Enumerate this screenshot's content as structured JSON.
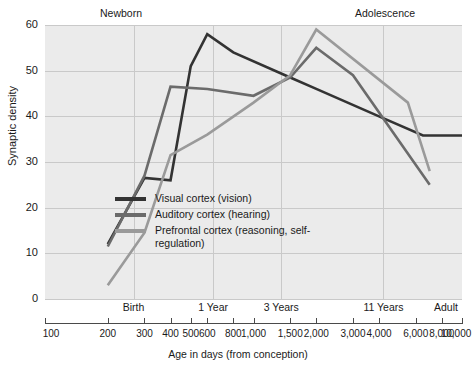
{
  "chart_data": {
    "type": "line",
    "title": "",
    "xlabel": "Age in days (from conception)",
    "ylabel": "Synaptic density",
    "xscale": "log",
    "xlim": [
      100,
      10000
    ],
    "ylim": [
      0,
      60
    ],
    "yticks": [
      0,
      10,
      20,
      30,
      40,
      50,
      60
    ],
    "xticks": [
      100,
      200,
      300,
      400,
      500,
      600,
      800,
      1000,
      1500,
      2000,
      3000,
      4000,
      6000,
      8000,
      10000
    ],
    "xtick_labels": [
      "100",
      "200",
      "300",
      "400",
      "500",
      "600",
      "800",
      "1,000",
      "1,500",
      "2,000",
      "3,000",
      "4,000",
      "6,000",
      "8,000",
      "10,000"
    ],
    "grid": true,
    "legend_position": "lower-center-left",
    "era_annotations": [
      {
        "label": "Newborn",
        "position": "top-left"
      },
      {
        "label": "Adolescence",
        "position": "top-right"
      }
    ],
    "stage_ticks": [
      {
        "label": "Birth",
        "x": 266
      },
      {
        "label": "1 Year",
        "x": 640
      },
      {
        "label": "3 Years",
        "x": 1360
      },
      {
        "label": "11 Years",
        "x": 4200
      },
      {
        "label": "Adult",
        "x": 10000
      }
    ],
    "series": [
      {
        "name": "Visual cortex (vision)",
        "color": "#333333",
        "x": [
          200,
          300,
          400,
          500,
          600,
          800,
          1500,
          2000,
          4000,
          6500,
          10000
        ],
        "y": [
          12,
          26.5,
          26,
          51,
          58,
          54,
          48.5,
          46,
          40,
          35.8,
          35.8
        ]
      },
      {
        "name": "Auditory cortex (hearing)",
        "color": "#6b6b6b",
        "x": [
          200,
          300,
          400,
          600,
          1000,
          1500,
          2000,
          3000,
          7000
        ],
        "y": [
          11.5,
          27,
          46.5,
          46,
          44.5,
          48.5,
          55,
          49,
          25
        ]
      },
      {
        "name": "Prefrontal cortex (reasoning, self-regulation)",
        "color": "#9a9a9a",
        "x": [
          200,
          300,
          400,
          600,
          1000,
          1500,
          2000,
          5500,
          7000
        ],
        "y": [
          3,
          14.5,
          31.5,
          36,
          43,
          49,
          59,
          43,
          28
        ]
      }
    ]
  },
  "axis": {
    "ylabel": "Synaptic density",
    "xlabel": "Age in days (from conception)"
  },
  "legend": {
    "items": [
      {
        "label": "Visual cortex (vision)",
        "color": "#333333"
      },
      {
        "label": "Auditory cortex (hearing)",
        "color": "#6b6b6b"
      },
      {
        "label": "Prefrontal cortex (reasoning, self-regulation)",
        "color": "#9a9a9a"
      }
    ]
  },
  "annotations": {
    "newborn": "Newborn",
    "adolescence": "Adolescence"
  }
}
